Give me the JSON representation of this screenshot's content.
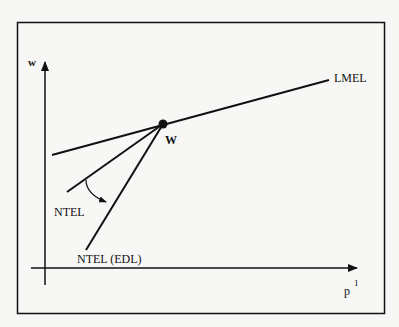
{
  "diagram": {
    "axes": {
      "y_label": "w",
      "x_label": "p",
      "x_label_superscript": "1"
    },
    "point": {
      "label": "W"
    },
    "lines": [
      {
        "id": "lmel",
        "label": "LMEL"
      },
      {
        "id": "ntel",
        "label": "NTEL"
      },
      {
        "id": "ntel-edl",
        "label": "NTEL (EDL)"
      }
    ],
    "colors": {
      "ink": "#111111",
      "background": "#f7f7f5"
    }
  }
}
